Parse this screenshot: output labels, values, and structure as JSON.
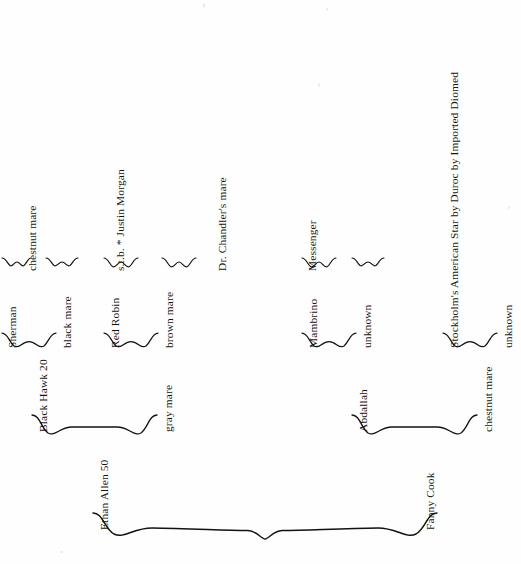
{
  "document": {
    "kind": "pedigree-chart",
    "subject": "Ethan Allen 50",
    "orientation": "rotated-90-clockwise",
    "background_color": "#fefefe",
    "ink_color": "#15120f"
  },
  "labels": {
    "gen1_sire": "Ethan Allen 50",
    "gen1_dam": "Fanny Cook",
    "gen2_a": "Black Hawk 20",
    "gen2_b": "gray mare",
    "gen2_c": "Abdallah",
    "gen2_d": "chestnut mare",
    "gen3_a": "Sherman",
    "gen3_b": "black mare",
    "gen3_c": "Red Robin",
    "gen3_d": "brown mare",
    "gen3_e": "Mambrino",
    "gen3_f": "unknown",
    "gen3_g": "Stockholm's American Star by Duroc by Imported Diomed",
    "gen3_h": "unknown",
    "gen4_a": "chestnut mare",
    "gen4_b": "s.t.b. * Justin Morgan",
    "gen4_c": "Dr. Chandler's mare",
    "gen4_d": "Messenger"
  },
  "pedigree": {
    "name": "Ethan Allen 50",
    "sire": {
      "name": "Black Hawk 20",
      "sire": {
        "name": "Sherman",
        "sire": {
          "name": "chestnut mare"
        },
        "dam": {
          "name": ""
        }
      },
      "dam": {
        "name": "black mare",
        "sire": {
          "name": "s.t.b. * Justin Morgan"
        },
        "dam": {
          "name": ""
        }
      }
    },
    "dam": {
      "name": "gray mare",
      "sire": {
        "name": "Red Robin",
        "sire": {
          "name": "Dr. Chandler's mare"
        },
        "dam": {
          "name": ""
        }
      },
      "dam": {
        "name": "brown mare",
        "sire": {
          "name": ""
        },
        "dam": {
          "name": ""
        }
      }
    },
    "second_parent": {
      "name": "Fanny Cook",
      "sire": {
        "name": "Abdallah",
        "sire": {
          "name": "Mambrino",
          "sire": {
            "name": "Messenger"
          },
          "dam": {
            "name": ""
          }
        },
        "dam": {
          "name": "unknown",
          "sire": {
            "name": ""
          },
          "dam": {
            "name": ""
          }
        }
      },
      "dam": {
        "name": "chestnut mare",
        "sire": {
          "name": "Stockholm's American Star by Duroc by Imported Diomed"
        },
        "dam": {
          "name": "unknown"
        }
      }
    }
  },
  "footnote_marker": "*"
}
